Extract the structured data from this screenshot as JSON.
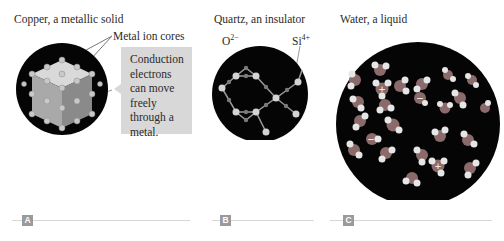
{
  "panels": [
    {
      "id": "A",
      "title": "Copper, a metallic solid",
      "annotation": "Metal ion cores",
      "callout": [
        "Conduction",
        "electrons",
        "can move",
        "freely",
        "through a",
        "metal."
      ],
      "tag": "A"
    },
    {
      "id": "B",
      "title": "Quartz, an insulator",
      "labels": {
        "oxygen": "O",
        "oxygen_charge": "2−",
        "silicon": "Si",
        "silicon_charge": "4+"
      },
      "tag": "B"
    },
    {
      "id": "C",
      "title": "Water, a liquid",
      "ion_symbols": {
        "cation": "+",
        "anion": "−"
      },
      "tag": "C"
    }
  ],
  "colors": {
    "background": "#ffffff",
    "sphere": "#050505",
    "cube_top": "#d9d9d9",
    "cube_left": "#a9a9a9",
    "cube_right": "#8a8a8a",
    "ion": "#c8c8c8",
    "callout_bg": "#d8d8d8",
    "tag_bg": "#9a9a9a",
    "rule": "#d6d6d6"
  }
}
